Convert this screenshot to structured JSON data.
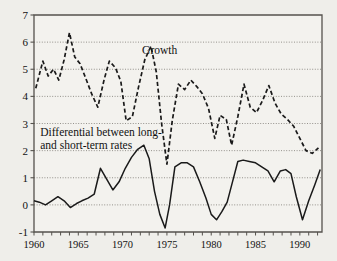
{
  "figure": {
    "background_color": "#efeeea",
    "plot_background_color": "#f3f2ee",
    "axis_color": "#55524d",
    "grid_color": "#6b6862",
    "line_color": "#1a1a1a"
  },
  "chart_data": {
    "type": "line",
    "title": "",
    "subtitle": "",
    "xlabel": "",
    "ylabel": "",
    "xlim": [
      1960,
      1992.5
    ],
    "ylim": [
      -1,
      7
    ],
    "grid": true,
    "grid_axis": "y",
    "legend": "inline-annotations",
    "yticks": [
      -1,
      0,
      1,
      2,
      3,
      4,
      5,
      6,
      7
    ],
    "ytick_labels": [
      "-1",
      "0",
      "1",
      "2",
      "3",
      "4",
      "5",
      "6",
      "7"
    ],
    "xticks": [
      1960,
      1961,
      1962,
      1963,
      1964,
      1965,
      1966,
      1967,
      1968,
      1969,
      1970,
      1971,
      1972,
      1973,
      1974,
      1975,
      1976,
      1977,
      1978,
      1979,
      1980,
      1981,
      1982,
      1983,
      1984,
      1985,
      1986,
      1987,
      1988,
      1989,
      1990,
      1991,
      1992
    ],
    "xtick_labels_shown": [
      "1960",
      "1965",
      "1970",
      "1975",
      "1980",
      "1985",
      "1990"
    ],
    "xtick_label_years": [
      1960,
      1965,
      1970,
      1975,
      1980,
      1985,
      1990
    ],
    "annotations": [
      {
        "name": "growth-label",
        "text": "Growth",
        "x_year": 1972.2,
        "y_value": 5.55
      },
      {
        "name": "differential-label",
        "text_line1": "Differential between long-",
        "text_line2": "and short-term rates",
        "x_year": 1960.7,
        "y_value": 2.55
      }
    ],
    "series": [
      {
        "name": "Growth",
        "style": "dashed",
        "x": [
          1960.2,
          1961.0,
          1961.6,
          1962.2,
          1962.8,
          1963.4,
          1964.0,
          1964.6,
          1965.2,
          1965.8,
          1966.5,
          1967.2,
          1967.9,
          1968.5,
          1969.2,
          1969.8,
          1970.4,
          1971.1,
          1971.8,
          1972.5,
          1973.2,
          1973.8,
          1974.4,
          1975.0,
          1975.6,
          1976.3,
          1977.0,
          1977.7,
          1978.4,
          1979.0,
          1979.7,
          1980.4,
          1981.0,
          1981.7,
          1982.3,
          1983.0,
          1983.7,
          1984.4,
          1985.1,
          1985.8,
          1986.5,
          1987.2,
          1987.9,
          1988.6,
          1989.3,
          1990.0,
          1990.7,
          1991.4,
          1992.1
        ],
        "y": [
          4.3,
          5.3,
          4.75,
          5.0,
          4.6,
          5.35,
          6.35,
          5.45,
          5.2,
          4.7,
          4.1,
          3.6,
          4.6,
          5.3,
          5.05,
          4.55,
          3.1,
          3.25,
          4.35,
          5.35,
          5.85,
          4.9,
          3.0,
          1.5,
          3.1,
          4.45,
          4.25,
          4.6,
          4.35,
          4.1,
          3.55,
          2.45,
          3.3,
          3.15,
          2.2,
          3.25,
          4.45,
          3.6,
          3.4,
          3.85,
          4.4,
          3.75,
          3.35,
          3.15,
          2.9,
          2.45,
          2.0,
          1.9,
          2.1
        ]
      },
      {
        "name": "Differential between long- and short-term rates",
        "style": "solid",
        "x": [
          1960.0,
          1960.6,
          1961.3,
          1962.0,
          1962.7,
          1963.4,
          1964.1,
          1964.8,
          1965.4,
          1966.1,
          1966.8,
          1967.5,
          1968.2,
          1968.9,
          1969.6,
          1970.3,
          1971.0,
          1971.7,
          1972.4,
          1973.0,
          1973.6,
          1974.2,
          1974.8,
          1975.3,
          1975.9,
          1976.6,
          1977.3,
          1978.0,
          1978.7,
          1979.4,
          1980.0,
          1980.6,
          1981.2,
          1981.8,
          1982.4,
          1983.0,
          1983.6,
          1984.3,
          1985.0,
          1985.7,
          1986.4,
          1987.1,
          1987.8,
          1988.4,
          1989.0,
          1989.6,
          1990.3,
          1991.0,
          1991.7,
          1992.3
        ],
        "y": [
          0.15,
          0.1,
          0.0,
          0.15,
          0.3,
          0.15,
          -0.1,
          0.05,
          0.15,
          0.25,
          0.4,
          1.35,
          0.95,
          0.55,
          0.85,
          1.35,
          1.75,
          2.05,
          2.2,
          1.7,
          0.5,
          -0.35,
          -0.85,
          0.0,
          1.4,
          1.55,
          1.55,
          1.4,
          0.85,
          0.25,
          -0.35,
          -0.55,
          -0.25,
          0.1,
          0.85,
          1.6,
          1.65,
          1.6,
          1.55,
          1.4,
          1.25,
          0.85,
          1.25,
          1.3,
          1.15,
          0.3,
          -0.55,
          0.15,
          0.75,
          1.3
        ]
      }
    ]
  }
}
